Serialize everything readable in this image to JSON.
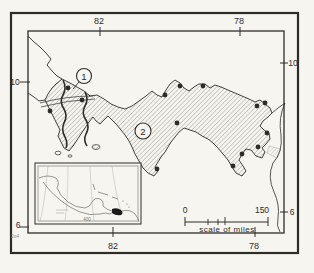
{
  "colors": {
    "paper": "#f7f5f0",
    "ink": "#2e2c29",
    "hatch": "#5f5d58",
    "hatch_light": "#9b9892",
    "faint": "#8d8a84"
  },
  "graticule": {
    "top": [
      "82",
      "78"
    ],
    "bottom": [
      "82",
      "78"
    ],
    "left": [
      "10",
      "6"
    ],
    "right": [
      "10",
      "6"
    ]
  },
  "region_markers": [
    {
      "label": "1"
    },
    {
      "label": "2"
    }
  ],
  "scale_bar": {
    "start": "0",
    "end": "150",
    "caption": "scale of miles"
  },
  "inset": {
    "scale_label": "400"
  },
  "corner_mark": "2x4",
  "localities": [
    [
      68,
      88
    ],
    [
      82,
      100
    ],
    [
      50,
      111
    ],
    [
      165,
      95
    ],
    [
      180,
      86
    ],
    [
      203,
      86
    ],
    [
      177,
      123
    ],
    [
      157,
      169
    ],
    [
      257,
      106
    ],
    [
      265,
      103
    ],
    [
      267,
      133
    ],
    [
      258,
      147
    ],
    [
      242,
      154
    ],
    [
      233,
      166
    ]
  ]
}
